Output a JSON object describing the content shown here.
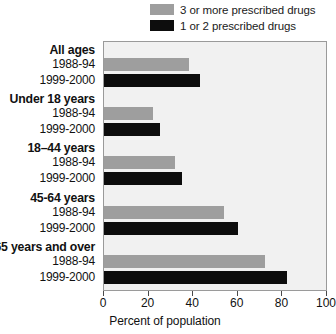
{
  "chart_data": {
    "type": "bar",
    "orientation": "horizontal",
    "title": "",
    "xlabel": "Percent of population",
    "ylabel": "",
    "xlim": [
      0,
      100
    ],
    "xticks": [
      0,
      20,
      40,
      60,
      80,
      100
    ],
    "xtick_labels": [
      "0",
      "20",
      "40",
      "60",
      "80",
      "100"
    ],
    "grid": false,
    "legend_position": "top-right",
    "legend": [
      {
        "name": "3 or more prescribed drugs",
        "color": "#9e9e9e"
      },
      {
        "name": "1 or 2 prescribed drugs",
        "color": "#0d0d0d"
      }
    ],
    "groups": [
      {
        "label": "All ages",
        "rows": [
          {
            "period": "1988-94",
            "series": "3 or more prescribed drugs",
            "value": 38
          },
          {
            "period": "1999-2000",
            "series": "1 or 2 prescribed drugs",
            "value": 43
          }
        ]
      },
      {
        "label": "Under 18 years",
        "rows": [
          {
            "period": "1988-94",
            "series": "3 or more prescribed drugs",
            "value": 22
          },
          {
            "period": "1999-2000",
            "series": "1 or 2 prescribed drugs",
            "value": 25
          }
        ]
      },
      {
        "label": "18–44 years",
        "rows": [
          {
            "period": "1988-94",
            "series": "3 or more prescribed drugs",
            "value": 32
          },
          {
            "period": "1999-2000",
            "series": "1 or 2 prescribed drugs",
            "value": 35
          }
        ]
      },
      {
        "label": "45-64 years",
        "rows": [
          {
            "period": "1988-94",
            "series": "3 or more prescribed drugs",
            "value": 54
          },
          {
            "period": "1999-2000",
            "series": "1 or 2 prescribed drugs",
            "value": 60
          }
        ]
      },
      {
        "label": "65 years and over",
        "rows": [
          {
            "period": "1988-94",
            "series": "3 or more prescribed drugs",
            "value": 72
          },
          {
            "period": "1999-2000",
            "series": "1 or 2 prescribed drugs",
            "value": 82
          }
        ]
      }
    ],
    "colors": {
      "series_gray": "#9e9e9e",
      "series_black": "#0d0d0d",
      "plot_background": "#f1f1f1",
      "plot_border": "#9a9a9a",
      "text": "#111111"
    }
  }
}
